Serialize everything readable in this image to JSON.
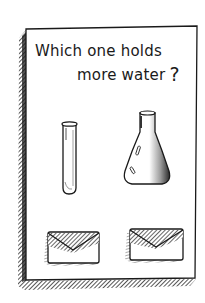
{
  "card": {
    "question_line1": "Which one holds",
    "question_line2": "more water",
    "question_mark": "?"
  },
  "options": [
    {
      "name": "test-tube",
      "label": "Test tube",
      "answer_slot": "envelope"
    },
    {
      "name": "erlenmeyer-flask",
      "label": "Flask",
      "answer_slot": "envelope"
    }
  ],
  "colors": {
    "ink": "#1a1a1a",
    "paper": "#ffffff",
    "shadow": "#3a3a3a"
  }
}
